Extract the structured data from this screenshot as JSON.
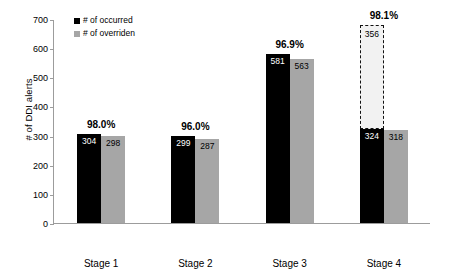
{
  "chart_data": {
    "type": "bar",
    "title": "",
    "xlabel": "",
    "ylabel": "# of DDI alerts",
    "ylim": [
      0,
      700
    ],
    "ytick_step": 100,
    "yticks": [
      0,
      100,
      200,
      300,
      400,
      500,
      600,
      700
    ],
    "ytick_labels": [
      "0",
      "100",
      "200",
      "300",
      "400",
      "500",
      "600",
      "700"
    ],
    "grid": false,
    "legend_position": "top-left-inside",
    "categories": [
      "Stage 1",
      "Stage 2",
      "Stage 3",
      "Stage 4"
    ],
    "series": [
      {
        "name": "# of occurred",
        "color": "#000000",
        "values": [
          304,
          298,
          581,
          563
        ]
      },
      {
        "name": "# of overriden",
        "color": "#a6a6a6",
        "values": [
          298,
          287,
          563,
          318
        ]
      }
    ],
    "bars": [
      {
        "category": "Stage 1",
        "occurred": 304,
        "overridden": 298,
        "occurred_label": "304",
        "overridden_label": "298",
        "pct_label": "98.0%",
        "projected": null,
        "projected_label": ""
      },
      {
        "category": "Stage 2",
        "occurred": 299,
        "overridden": 287,
        "occurred_label": "299",
        "overridden_label": "287",
        "pct_label": "96.0%",
        "projected": null,
        "projected_label": ""
      },
      {
        "category": "Stage 3",
        "occurred": 581,
        "overridden": 563,
        "occurred_label": "581",
        "overridden_label": "563",
        "pct_label": "96.9%",
        "projected": null,
        "projected_label": ""
      },
      {
        "category": "Stage 4",
        "occurred": 324,
        "overridden": 318,
        "occurred_label": "324",
        "overridden_label": "318",
        "pct_label": "98.1%",
        "projected": 356,
        "projected_label": "356"
      }
    ],
    "annotations": [
      {
        "text": "98.0%",
        "category": "Stage 1"
      },
      {
        "text": "96.0%",
        "category": "Stage 2"
      },
      {
        "text": "96.9%",
        "category": "Stage 3"
      },
      {
        "text": "98.1%",
        "category": "Stage 4"
      }
    ],
    "legend": [
      {
        "label": "# of occurred",
        "color": "#000000"
      },
      {
        "label": "# of overriden",
        "color": "#a6a6a6"
      }
    ]
  }
}
